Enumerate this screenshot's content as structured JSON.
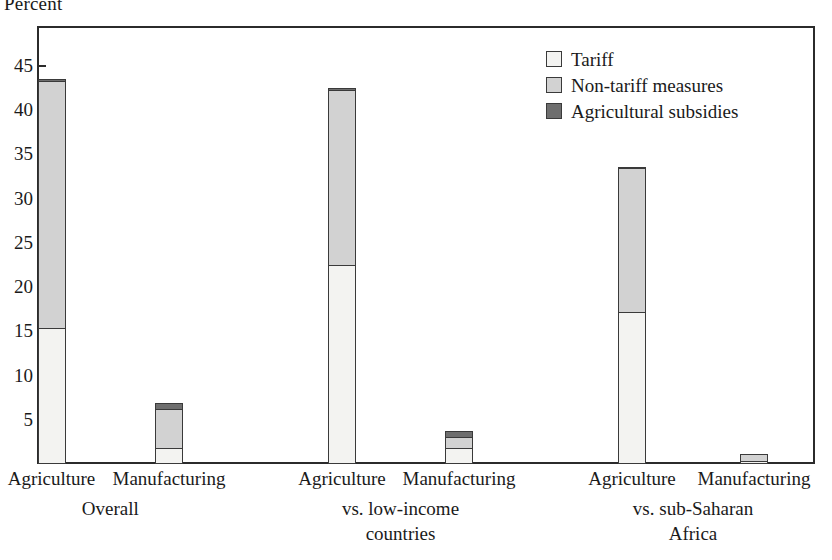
{
  "chart_data": {
    "type": "bar",
    "subtype": "stacked-bar",
    "title": "",
    "ylabel": "Percent",
    "xlabel": "",
    "ylim": [
      0,
      47
    ],
    "yticks": [
      5,
      10,
      15,
      20,
      25,
      30,
      35,
      40,
      45
    ],
    "grid": false,
    "legend_position": "top-right",
    "legend": [
      "Tariff",
      "Non-tariff measures",
      "Agricultural subsidies"
    ],
    "series": [
      {
        "name": "Tariff",
        "color": "#f3f3f1",
        "values": [
          15.4,
          1.8,
          22.5,
          1.8,
          17.2,
          0.3
        ]
      },
      {
        "name": "Non-tariff measures",
        "color": "#d2d2d2",
        "values": [
          28.1,
          4.6,
          20.0,
          1.4,
          16.4,
          1.0
        ]
      },
      {
        "name": "Agricultural subsidies",
        "color": "#6e6e6e",
        "values": [
          0.4,
          0.8,
          0.4,
          0.9,
          0.3,
          0.2
        ]
      }
    ],
    "categories": [
      "Agriculture",
      "Manufacturing",
      "Agriculture",
      "Manufacturing",
      "Agriculture",
      "Manufacturing"
    ],
    "totals": [
      43.9,
      7.2,
      42.9,
      4.1,
      33.9,
      1.5
    ],
    "groups": [
      {
        "label": "Overall",
        "lines": [
          "Overall"
        ]
      },
      {
        "label": "vs. low-income countries",
        "lines": [
          "vs. low-income",
          "countries"
        ]
      },
      {
        "label": "vs. sub-Saharan Africa",
        "lines": [
          "vs. sub-Saharan",
          "Africa"
        ]
      }
    ]
  },
  "axis": {
    "ylabel": "Percent",
    "ytick_labels": [
      "45",
      "40",
      "35",
      "30",
      "25",
      "20",
      "15",
      "10",
      "5"
    ]
  },
  "legend": {
    "items": [
      {
        "label": "Tariff",
        "color": "#f3f3f1"
      },
      {
        "label": "Non-tariff measures",
        "color": "#d2d2d2"
      },
      {
        "label": "Agricultural subsidies",
        "color": "#6e6e6e"
      }
    ]
  },
  "xaxis": {
    "categories": [
      "Agriculture",
      "Manufacturing",
      "Agriculture",
      "Manufacturing",
      "Agriculture",
      "Manufacturing"
    ],
    "group_lines": [
      [
        "Overall"
      ],
      [
        "vs. low-income",
        "countries"
      ],
      [
        "vs. sub-Saharan",
        "Africa"
      ]
    ]
  }
}
